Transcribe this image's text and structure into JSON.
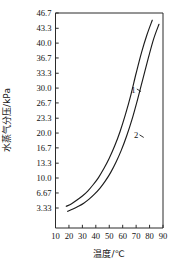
{
  "chart_data": {
    "type": "line",
    "title": "",
    "xlabel": "温度/℃",
    "ylabel": "水蒸气分压/kPa",
    "xlim": [
      10,
      90
    ],
    "ylim": [
      0,
      46.7
    ],
    "grid": false,
    "legend_position": "inline-curve-labels",
    "xticks": [
      10,
      20,
      30,
      40,
      50,
      60,
      70,
      80,
      90
    ],
    "xtick_labels": [
      "10",
      "20",
      "30",
      "40",
      "50",
      "60",
      "70",
      "80",
      "90"
    ],
    "yticks": [
      3.33,
      6.67,
      10.0,
      13.3,
      16.7,
      20.0,
      23.3,
      26.7,
      30.0,
      33.3,
      36.7,
      40.0,
      43.3,
      46.7
    ],
    "ytick_labels": [
      "3.33",
      "6.67",
      "10.0",
      "13.3",
      "16.7",
      "20.0",
      "23.3",
      "26.7",
      "30.0",
      "33.3",
      "36.7",
      "40.0",
      "43.3",
      "46.7"
    ],
    "series": [
      {
        "name": "1",
        "label": "1",
        "label_x": 68,
        "label_y": 29.0,
        "x": [
          18,
          22,
          26,
          30,
          34,
          38,
          42,
          46,
          50,
          54,
          58,
          62,
          66,
          70,
          74,
          78,
          82
        ],
        "y": [
          3.7,
          4.3,
          5.1,
          6.0,
          7.1,
          8.5,
          10.1,
          12.1,
          14.4,
          17.1,
          20.3,
          24.1,
          28.4,
          33.3,
          37.9,
          41.8,
          45.1
        ]
      },
      {
        "name": "2",
        "label": "2",
        "label_x": 70,
        "label_y": 18.8,
        "x": [
          19,
          23,
          27,
          31,
          35,
          39,
          43,
          47,
          51,
          55,
          59,
          63,
          67,
          71,
          75,
          79,
          83,
          87
        ],
        "y": [
          2.6,
          3.1,
          3.7,
          4.4,
          5.3,
          6.4,
          7.7,
          9.3,
          11.2,
          13.5,
          16.2,
          19.4,
          23.1,
          27.4,
          32.0,
          36.6,
          40.9,
          44.2
        ]
      }
    ]
  },
  "colors": {
    "curve": "#1c1c1c",
    "axis": "#2b2b2b",
    "background": "#ffffff",
    "text": "#111111"
  }
}
